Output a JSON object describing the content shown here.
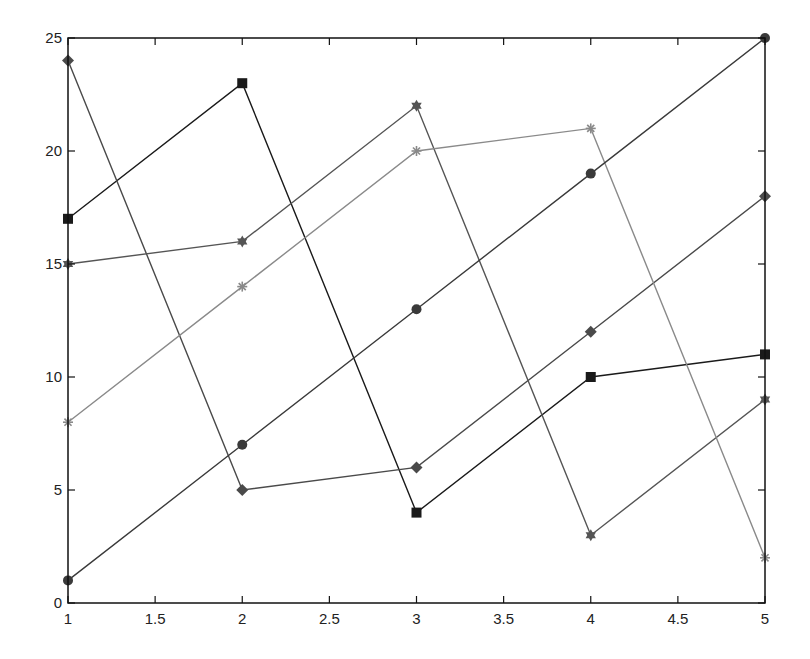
{
  "chart_data": {
    "type": "line",
    "title": "",
    "xlabel": "",
    "ylabel": "",
    "x": [
      1,
      2,
      3,
      4,
      5
    ],
    "xlim": [
      1,
      5
    ],
    "ylim": [
      0,
      25
    ],
    "xticks": [
      "1",
      "1.5",
      "2",
      "2.5",
      "3",
      "3.5",
      "4",
      "4.5",
      "5"
    ],
    "yticks": [
      "0",
      "5",
      "10",
      "15",
      "20",
      "25"
    ],
    "grid": false,
    "legend": null,
    "series": [
      {
        "name": "series-1",
        "marker": "square",
        "color": "#1a1a1a",
        "values": [
          17,
          23,
          4,
          10,
          11
        ]
      },
      {
        "name": "series-2",
        "marker": "diamond",
        "color": "#4a4a4a",
        "values": [
          24,
          5,
          6,
          12,
          18
        ]
      },
      {
        "name": "series-3",
        "marker": "hexagram",
        "color": "#555555",
        "values": [
          15,
          16,
          22,
          3,
          9
        ]
      },
      {
        "name": "series-4",
        "marker": "asterisk",
        "color": "#8a8a8a",
        "values": [
          8,
          14,
          20,
          21,
          2
        ]
      },
      {
        "name": "series-5",
        "marker": "circle",
        "color": "#3a3a3a",
        "values": [
          1,
          7,
          13,
          19,
          25
        ]
      }
    ]
  }
}
